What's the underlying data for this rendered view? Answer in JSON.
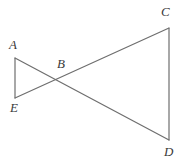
{
  "figure": {
    "background_color": "#ffffff",
    "stroke_color": "#6e6e6e",
    "label_color": "#3a3a3a",
    "stroke_width": 1.2,
    "width": 186,
    "height": 163,
    "labels": {
      "A": "A",
      "B": "B",
      "C": "C",
      "D": "D",
      "E": "E"
    },
    "points": {
      "A": {
        "x": 15,
        "y": 58
      },
      "B": {
        "x": 57,
        "y": 78
      },
      "C": {
        "x": 169,
        "y": 28
      },
      "D": {
        "x": 169,
        "y": 140
      },
      "E": {
        "x": 15,
        "y": 98
      }
    },
    "segments": [
      {
        "name": "segment-AE",
        "from": "A",
        "to": "E"
      },
      {
        "name": "segment-CD",
        "from": "C",
        "to": "D"
      },
      {
        "name": "segment-AD",
        "from": "A",
        "to": "D"
      },
      {
        "name": "segment-EC",
        "from": "E",
        "to": "C"
      }
    ]
  }
}
